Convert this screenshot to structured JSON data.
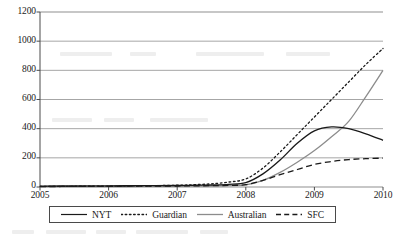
{
  "chart_data": {
    "type": "line",
    "title": "",
    "subtitle": "",
    "xlabel": "",
    "ylabel": "",
    "xlim": [
      2005,
      2010
    ],
    "ylim": [
      0,
      1200
    ],
    "grid": true,
    "grid_axis": "y",
    "legend_position": "bottom",
    "x_ticks": [
      "2005",
      "2006",
      "2007",
      "2008",
      "2009",
      "2010"
    ],
    "y_ticks": [
      "0",
      "200",
      "400",
      "600",
      "800",
      "1000",
      "1200"
    ],
    "x": [
      2005,
      2005.5,
      2006,
      2006.5,
      2007,
      2007.25,
      2007.5,
      2007.75,
      2008,
      2008.25,
      2008.5,
      2008.75,
      2009,
      2009.25,
      2009.5,
      2009.75,
      2010
    ],
    "series": [
      {
        "name": "NYT",
        "style": "solid",
        "color": "#1a1a1a",
        "values": [
          6,
          7,
          8,
          9,
          10,
          12,
          14,
          18,
          30,
          90,
          185,
          300,
          385,
          412,
          400,
          365,
          320
        ]
      },
      {
        "name": "Guardian",
        "style": "dotted",
        "color": "#1a1a1a",
        "values": [
          4,
          5,
          6,
          8,
          12,
          16,
          22,
          34,
          55,
          130,
          240,
          360,
          480,
          600,
          720,
          840,
          950
        ]
      },
      {
        "name": "Australian",
        "style": "solid",
        "color": "#8c8c8c",
        "values": [
          2,
          2,
          3,
          4,
          5,
          6,
          7,
          9,
          14,
          45,
          100,
          170,
          250,
          345,
          450,
          620,
          800
        ]
      },
      {
        "name": "SFC",
        "style": "dashed",
        "color": "#1a1a1a",
        "values": [
          3,
          4,
          5,
          6,
          7,
          8,
          9,
          11,
          16,
          45,
          85,
          120,
          155,
          175,
          188,
          194,
          198
        ]
      }
    ]
  },
  "legend": {
    "entries": [
      {
        "label": "NYT"
      },
      {
        "label": "Guardian"
      },
      {
        "label": "Australian"
      },
      {
        "label": "SFC"
      }
    ]
  }
}
